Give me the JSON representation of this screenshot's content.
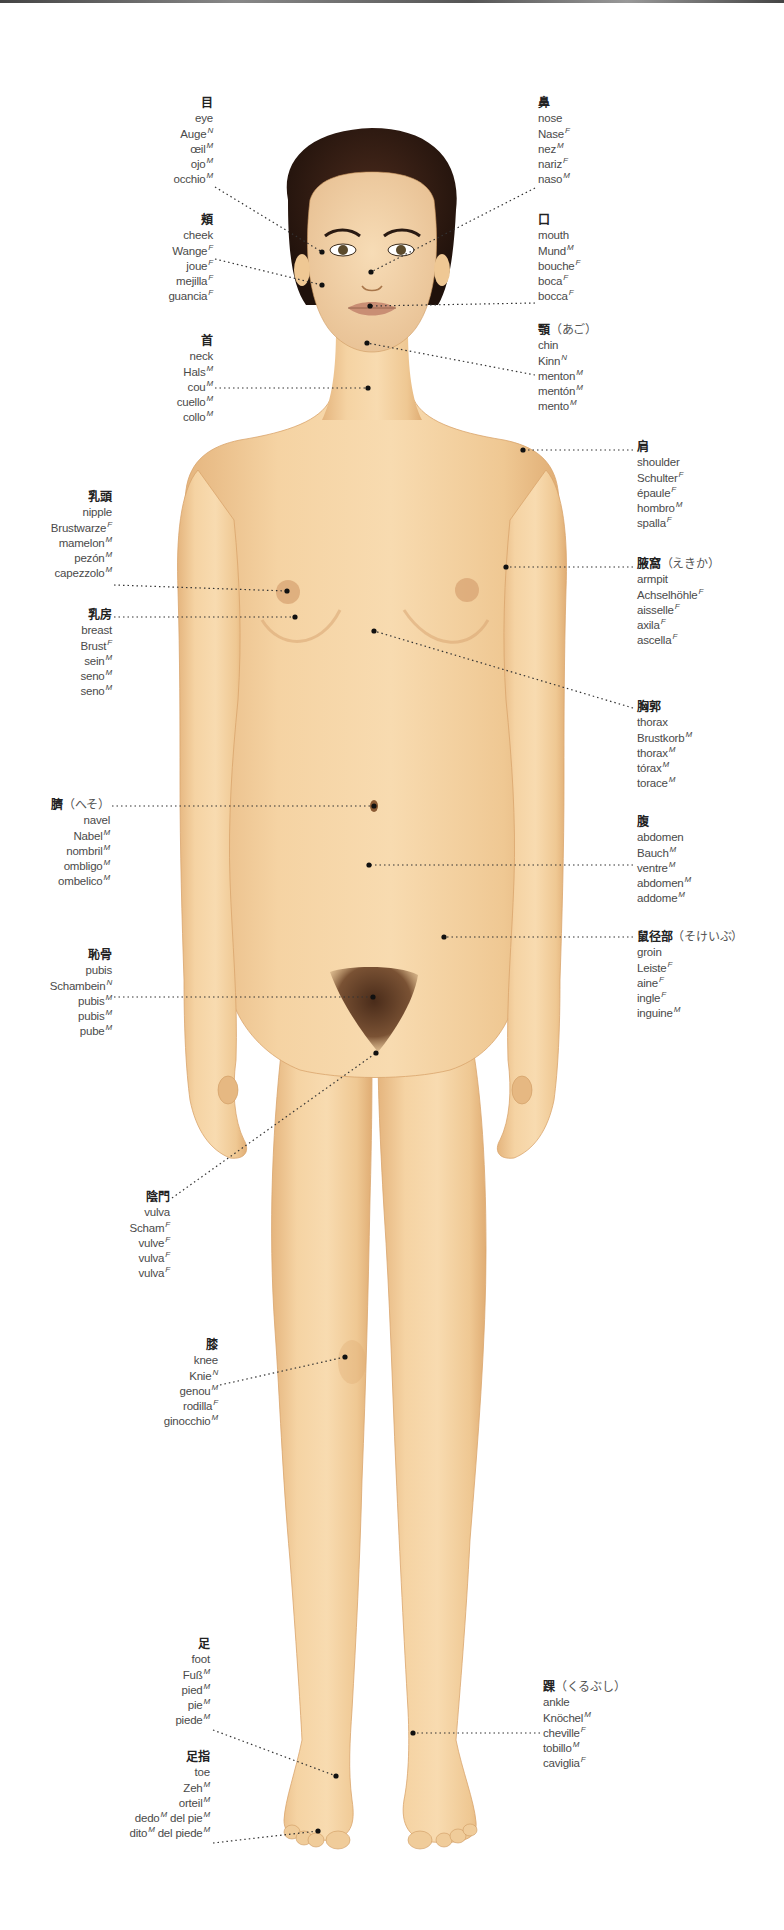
{
  "colors": {
    "skin": "#f3cf9e",
    "skin_shadow": "#e2b27a",
    "hair": "#2e1a12",
    "leader": "#333333",
    "text": "#4a4a4a"
  },
  "labels": [
    {
      "id": "eye",
      "side": "left",
      "x": 213,
      "y": 96,
      "jp": "目",
      "reading": "",
      "terms": [
        [
          "eye",
          ""
        ],
        [
          "Auge",
          "N"
        ],
        [
          "œil",
          "M"
        ],
        [
          "ojo",
          "M"
        ],
        [
          "occhio",
          "M"
        ]
      ],
      "dot": [
        322,
        252
      ],
      "anchor": [
        215,
        187
      ]
    },
    {
      "id": "cheek",
      "side": "left",
      "x": 213,
      "y": 213,
      "jp": "頬",
      "reading": "",
      "terms": [
        [
          "cheek",
          ""
        ],
        [
          "Wange",
          "F"
        ],
        [
          "joue",
          "F"
        ],
        [
          "mejilla",
          "F"
        ],
        [
          "guancia",
          "F"
        ]
      ],
      "dot": [
        322,
        285
      ],
      "anchor": [
        215,
        259
      ]
    },
    {
      "id": "neck",
      "side": "left",
      "x": 213,
      "y": 334,
      "jp": "首",
      "reading": "",
      "terms": [
        [
          "neck",
          ""
        ],
        [
          "Hals",
          "M"
        ],
        [
          "cou",
          "M"
        ],
        [
          "cuello",
          "M"
        ],
        [
          "collo",
          "M"
        ]
      ],
      "dot": [
        368,
        388
      ],
      "anchor": [
        215,
        388
      ]
    },
    {
      "id": "nose",
      "side": "right",
      "x": 538,
      "y": 96,
      "jp": "鼻",
      "reading": "",
      "terms": [
        [
          "nose",
          ""
        ],
        [
          "Nase",
          "F"
        ],
        [
          "nez",
          "M"
        ],
        [
          "nariz",
          "F"
        ],
        [
          "naso",
          "M"
        ]
      ],
      "dot": [
        371,
        272
      ],
      "anchor": [
        535,
        188
      ]
    },
    {
      "id": "mouth",
      "side": "right",
      "x": 538,
      "y": 213,
      "jp": "口",
      "reading": "",
      "terms": [
        [
          "mouth",
          ""
        ],
        [
          "Mund",
          "M"
        ],
        [
          "bouche",
          "F"
        ],
        [
          "boca",
          "F"
        ],
        [
          "bocca",
          "F"
        ]
      ],
      "dot": [
        370,
        306
      ],
      "anchor": [
        535,
        303
      ]
    },
    {
      "id": "chin",
      "side": "right",
      "x": 538,
      "y": 323,
      "jp": "顎",
      "reading": "（あご）",
      "terms": [
        [
          "chin",
          ""
        ],
        [
          "Kinn",
          "N"
        ],
        [
          "menton",
          "M"
        ],
        [
          "mentón",
          "M"
        ],
        [
          "mento",
          "M"
        ]
      ],
      "dot": [
        367,
        343
      ],
      "anchor": [
        535,
        375
      ]
    },
    {
      "id": "shoulder",
      "side": "right",
      "x": 637,
      "y": 440,
      "jp": "肩",
      "reading": "",
      "terms": [
        [
          "shoulder",
          ""
        ],
        [
          "Schulter",
          "F"
        ],
        [
          "épaule",
          "F"
        ],
        [
          "hombro",
          "M"
        ],
        [
          "spalla",
          "F"
        ]
      ],
      "dot": [
        523,
        450
      ],
      "anchor": [
        633,
        450
      ]
    },
    {
      "id": "armpit",
      "side": "right",
      "x": 637,
      "y": 557,
      "jp": "腋窩",
      "reading": "（えきか）",
      "terms": [
        [
          "armpit",
          ""
        ],
        [
          "Achselhöhle",
          "F"
        ],
        [
          "aisselle",
          "F"
        ],
        [
          "axila",
          "F"
        ],
        [
          "ascella",
          "F"
        ]
      ],
      "dot": [
        506,
        567
      ],
      "anchor": [
        633,
        567
      ]
    },
    {
      "id": "thorax",
      "side": "right",
      "x": 637,
      "y": 700,
      "jp": "胸郭",
      "reading": "",
      "terms": [
        [
          "thorax",
          ""
        ],
        [
          "Brustkorb",
          "M"
        ],
        [
          "thorax",
          "M"
        ],
        [
          "tórax",
          "M"
        ],
        [
          "torace",
          "M"
        ]
      ],
      "dot": [
        374,
        631
      ],
      "anchor": [
        633,
        708
      ]
    },
    {
      "id": "abdomen",
      "side": "right",
      "x": 637,
      "y": 815,
      "jp": "腹",
      "reading": "",
      "terms": [
        [
          "abdomen",
          ""
        ],
        [
          "Bauch",
          "M"
        ],
        [
          "ventre",
          "M"
        ],
        [
          "abdomen",
          "M"
        ],
        [
          "addome",
          "M"
        ]
      ],
      "dot": [
        369,
        865
      ],
      "anchor": [
        633,
        865
      ]
    },
    {
      "id": "groin",
      "side": "right",
      "x": 637,
      "y": 930,
      "jp": "鼠径部",
      "reading": "（そけいぶ）",
      "terms": [
        [
          "groin",
          ""
        ],
        [
          "Leiste",
          "F"
        ],
        [
          "aine",
          "F"
        ],
        [
          "ingle",
          "F"
        ],
        [
          "inguine",
          "M"
        ]
      ],
      "dot": [
        444,
        937
      ],
      "anchor": [
        633,
        937
      ]
    },
    {
      "id": "nipple",
      "side": "left",
      "x": 112,
      "y": 490,
      "jp": "乳頭",
      "reading": "",
      "terms": [
        [
          "nipple",
          ""
        ],
        [
          "Brustwarze",
          "F"
        ],
        [
          "mamelon",
          "M"
        ],
        [
          "pezón",
          "M"
        ],
        [
          "capezzolo",
          "M"
        ]
      ],
      "dot": [
        287,
        591
      ],
      "anchor": [
        114,
        585
      ]
    },
    {
      "id": "breast",
      "side": "left",
      "x": 112,
      "y": 608,
      "jp": "乳房",
      "reading": "",
      "terms": [
        [
          "breast",
          ""
        ],
        [
          "Brust",
          "F"
        ],
        [
          "sein",
          "M"
        ],
        [
          "seno",
          "M"
        ],
        [
          "seno",
          "M"
        ]
      ],
      "dot": [
        295,
        617
      ],
      "anchor": [
        114,
        617
      ]
    },
    {
      "id": "navel",
      "side": "left",
      "x": 110,
      "y": 798,
      "jp": "臍",
      "reading": "（へそ）",
      "terms": [
        [
          "navel",
          ""
        ],
        [
          "Nabel",
          "M"
        ],
        [
          "nombril",
          "M"
        ],
        [
          "ombligo",
          "M"
        ],
        [
          "ombelico",
          "M"
        ]
      ],
      "dot": [
        374,
        806
      ],
      "anchor": [
        112,
        806
      ]
    },
    {
      "id": "pubis",
      "side": "left",
      "x": 112,
      "y": 948,
      "jp": "恥骨",
      "reading": "",
      "terms": [
        [
          "pubis",
          ""
        ],
        [
          "Schambein",
          "N"
        ],
        [
          "pubis",
          "M"
        ],
        [
          "pubis",
          "M"
        ],
        [
          "pube",
          "M"
        ]
      ],
      "dot": [
        373,
        997
      ],
      "anchor": [
        114,
        997
      ]
    },
    {
      "id": "vulva",
      "side": "left",
      "x": 170,
      "y": 1190,
      "jp": "陰門",
      "reading": "",
      "terms": [
        [
          "vulva",
          ""
        ],
        [
          "Scham",
          "F"
        ],
        [
          "vulve",
          "F"
        ],
        [
          "vulva",
          "F"
        ],
        [
          "vulva",
          "F"
        ]
      ],
      "dot": [
        376,
        1053
      ],
      "anchor": [
        172,
        1198
      ]
    },
    {
      "id": "knee",
      "side": "left",
      "x": 218,
      "y": 1338,
      "jp": "膝",
      "reading": "",
      "terms": [
        [
          "knee",
          ""
        ],
        [
          "Knie",
          "N"
        ],
        [
          "genou",
          "M"
        ],
        [
          "rodilla",
          "F"
        ],
        [
          "ginocchio",
          "M"
        ]
      ],
      "dot": [
        345,
        1357
      ],
      "anchor": [
        220,
        1385
      ]
    },
    {
      "id": "foot",
      "side": "left",
      "x": 210,
      "y": 1637,
      "jp": "足",
      "reading": "",
      "terms": [
        [
          "foot",
          ""
        ],
        [
          "Fuß",
          "M"
        ],
        [
          "pied",
          "M"
        ],
        [
          "pie",
          "M"
        ],
        [
          "piede",
          "M"
        ]
      ],
      "dot": [
        336,
        1776
      ],
      "anchor": [
        213,
        1730
      ]
    },
    {
      "id": "toe",
      "side": "left",
      "x": 210,
      "y": 1750,
      "jp": "足指",
      "reading": "",
      "terms": [
        [
          "toe",
          ""
        ],
        [
          "Zeh",
          "M"
        ],
        [
          "orteil",
          "M"
        ],
        [
          "dedo",
          "M",
          "del pie",
          "M"
        ],
        [
          "dito",
          "M",
          "del piede",
          "M"
        ]
      ],
      "dot": [
        318,
        1831
      ],
      "anchor": [
        213,
        1843
      ]
    },
    {
      "id": "ankle",
      "side": "right",
      "x": 543,
      "y": 1680,
      "jp": "踝",
      "reading": "（くるぶし）",
      "terms": [
        [
          "ankle",
          ""
        ],
        [
          "Knöchel",
          "M"
        ],
        [
          "cheville",
          "F"
        ],
        [
          "tobillo",
          "M"
        ],
        [
          "caviglia",
          "F"
        ]
      ],
      "dot": [
        413,
        1733
      ],
      "anchor": [
        540,
        1733
      ]
    }
  ]
}
